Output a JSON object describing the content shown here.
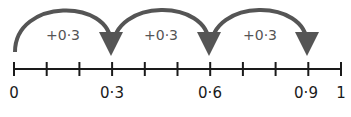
{
  "number_line": {
    "min": 0,
    "max": 1,
    "step": 0.1,
    "labels": [
      {
        "text": "0",
        "value": 0
      },
      {
        "text": "0·3",
        "value": 0.3
      },
      {
        "text": "0·6",
        "value": 0.6
      },
      {
        "text": "0·9",
        "value": 0.9
      },
      {
        "text": "1",
        "value": 1
      }
    ]
  },
  "jumps": [
    {
      "from": 0,
      "to": 0.3,
      "label": "+0·3"
    },
    {
      "from": 0.3,
      "to": 0.6,
      "label": "+0·3"
    },
    {
      "from": 0.6,
      "to": 0.9,
      "label": "+0·3"
    }
  ],
  "colors": {
    "line": "#1a1a1a",
    "arrow": "#555555"
  }
}
